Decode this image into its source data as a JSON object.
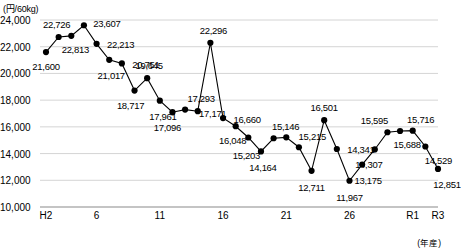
{
  "chart_data": {
    "type": "line",
    "title": "",
    "xlabel": "(年産)",
    "ylabel": "(円/60kg)",
    "ylim": [
      10000,
      24000
    ],
    "ytick_labels": [
      "10,000",
      "12,000",
      "14,000",
      "16,000",
      "18,000",
      "20,000",
      "22,000",
      "24,000"
    ],
    "ytick_values": [
      10000,
      12000,
      14000,
      16000,
      18000,
      20000,
      22000,
      24000
    ],
    "xtick_labels": [
      "H2",
      "6",
      "11",
      "16",
      "21",
      "26",
      "R1",
      "R3"
    ],
    "xtick_values": [
      2,
      6,
      11,
      16,
      21,
      26,
      31,
      33
    ],
    "grid": true,
    "legend": "none",
    "categories": [
      "H2",
      "H3",
      "H4",
      "H5",
      "H6",
      "H7",
      "H8",
      "H9",
      "H10",
      "H11",
      "H12",
      "H13",
      "H14",
      "H15",
      "H16",
      "H17",
      "H18",
      "H19",
      "H20",
      "H21",
      "H22",
      "H23",
      "H24",
      "H25",
      "H26",
      "H27",
      "H28",
      "H29",
      "H30",
      "R1",
      "R2",
      "R3"
    ],
    "x": [
      2,
      3,
      4,
      5,
      6,
      7,
      8,
      9,
      10,
      11,
      12,
      13,
      14,
      15,
      16,
      17,
      18,
      19,
      20,
      21,
      22,
      23,
      24,
      25,
      26,
      27,
      28,
      29,
      30,
      31,
      32,
      33
    ],
    "values": [
      21600,
      22726,
      22813,
      23607,
      22213,
      21017,
      20751,
      18717,
      19645,
      17961,
      17096,
      17293,
      17171,
      22296,
      16660,
      16048,
      15203,
      14164,
      15146,
      15215,
      14475,
      12711,
      16501,
      14341,
      11967,
      13175,
      14307,
      15595,
      15688,
      15716,
      14529,
      12851
    ],
    "point_labels": [
      "21,600",
      "22,726",
      "22,813",
      "23,607",
      "22,213",
      "21,017",
      "20,751",
      "18,717",
      "19,645",
      "17,961",
      "17,096",
      "17,293",
      "17,171",
      "22,296",
      "16,660",
      "16,048",
      "15,203",
      "14,164",
      "15,146",
      "15,215",
      "",
      "12,711",
      "16,501",
      "14,341",
      "11,967",
      "13,175",
      "14,307",
      "15,595",
      "15,688",
      "15,716",
      "14,529",
      "12,851"
    ],
    "colors": {
      "line": "#000000",
      "marker": "#000000",
      "grid": "#c9c9c9",
      "axis": "#8a8a8a"
    }
  }
}
